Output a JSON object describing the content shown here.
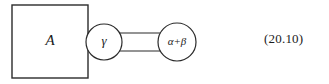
{
  "figure": {
    "kind": "feynman-style-diagram",
    "background_color": "#ffffff",
    "stroke_color": "#2b2b2b",
    "text_color": "#1a1a1a",
    "nodes": [
      {
        "id": "blob-a",
        "shape": "square",
        "label": "A",
        "x": 12,
        "y": 5,
        "width": 76,
        "height": 73
      },
      {
        "id": "vertex-gamma",
        "shape": "circle",
        "label": "γ",
        "cx": 104,
        "cy": 42,
        "r": 18
      },
      {
        "id": "vertex-alpha-beta",
        "shape": "circle",
        "label": "α+β",
        "cx": 177,
        "cy": 42,
        "r": 19
      }
    ],
    "connectors": [
      {
        "id": "double-line-upper",
        "from": "vertex-gamma",
        "to": "vertex-alpha-beta",
        "x1": 121,
        "y1": 33,
        "x2": 160,
        "y2": 33
      },
      {
        "id": "double-line-lower",
        "from": "vertex-gamma",
        "to": "vertex-alpha-beta",
        "x1": 121,
        "y1": 51,
        "x2": 160,
        "y2": 51
      }
    ],
    "equation_number": "(20.10)"
  }
}
